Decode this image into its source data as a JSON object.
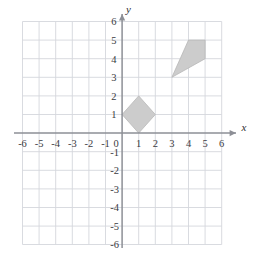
{
  "figure": {
    "title": "",
    "x_axis_label": "x",
    "y_axis_label": "y",
    "x_tick_labels": [
      "-6",
      "-5",
      "-4",
      "-3",
      "-2",
      "-1",
      "0",
      "1",
      "2",
      "3",
      "4",
      "5",
      "6"
    ],
    "y_tick_labels": [
      "6",
      "5",
      "4",
      "3",
      "2",
      "1",
      "-1",
      "-2",
      "-3",
      "-4",
      "-5",
      "-6"
    ],
    "origin_label": "0"
  },
  "chart_data": {
    "type": "scatter",
    "title": "",
    "xlabel": "x",
    "ylabel": "y",
    "xlim": [
      -6,
      6
    ],
    "ylim": [
      -6,
      6
    ],
    "grid": true,
    "legend": "none",
    "x_ticks": [
      -6,
      -5,
      -4,
      -3,
      -2,
      -1,
      0,
      1,
      2,
      3,
      4,
      5,
      6
    ],
    "y_ticks": [
      -6,
      -5,
      -4,
      -3,
      -2,
      -1,
      0,
      1,
      2,
      3,
      4,
      5,
      6
    ],
    "shapes": [
      {
        "name": "small-quadrilateral",
        "kind": "polygon",
        "fill": "#cccccc",
        "stroke": "#b8b8b8",
        "vertices": [
          [
            0,
            1
          ],
          [
            1,
            2
          ],
          [
            2,
            1
          ],
          [
            1,
            0
          ]
        ]
      },
      {
        "name": "large-quadrilateral",
        "kind": "polygon",
        "fill": "#cccccc",
        "stroke": "#b8b8b8",
        "vertices": [
          [
            3,
            3
          ],
          [
            4,
            5
          ],
          [
            5,
            5
          ],
          [
            5,
            4
          ]
        ]
      }
    ],
    "colors": {
      "shape_fill": "#cccccc",
      "shape_stroke": "#b8b8b8",
      "grid": "#d5d7dc",
      "axis": "#8d8f96",
      "label": "#3b3b3f",
      "background": "#ffffff"
    }
  }
}
